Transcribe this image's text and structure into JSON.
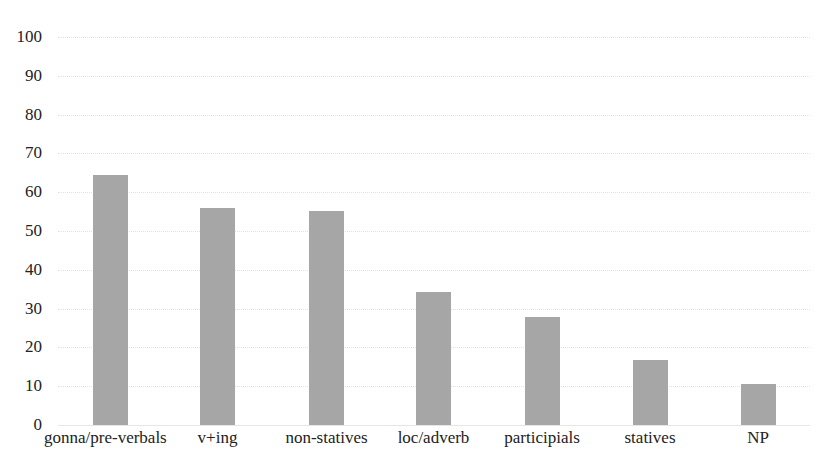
{
  "chart_data": {
    "type": "bar",
    "title": "",
    "xlabel": "",
    "ylabel": "",
    "categories": [
      "gonna/pre-verbals",
      "v+ing",
      "non-statives",
      "loc/adverb",
      "participials",
      "statives",
      "NP"
    ],
    "values": [
      64.5,
      56,
      55.2,
      34.3,
      27.8,
      16.8,
      10.6
    ],
    "ylim": [
      0,
      100
    ],
    "yticks": [
      "0",
      "10",
      "20",
      "30",
      "40",
      "50",
      "60",
      "70",
      "80",
      "90",
      "100"
    ],
    "grid": true,
    "legend": null,
    "bar_color": "#a6a6a6"
  }
}
